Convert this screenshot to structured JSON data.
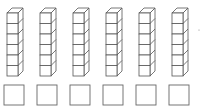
{
  "diagram": {
    "rods": [
      {
        "cubes": 6,
        "answer": ""
      },
      {
        "cubes": 6,
        "answer": ""
      },
      {
        "cubes": 6,
        "answer": ""
      },
      {
        "cubes": 6,
        "answer": ""
      },
      {
        "cubes": 6,
        "answer": ""
      },
      {
        "cubes": 6,
        "answer": ""
      }
    ],
    "colors": {
      "stroke": "#555555",
      "fill": "#ffffff",
      "box_stroke": "#666666"
    }
  }
}
